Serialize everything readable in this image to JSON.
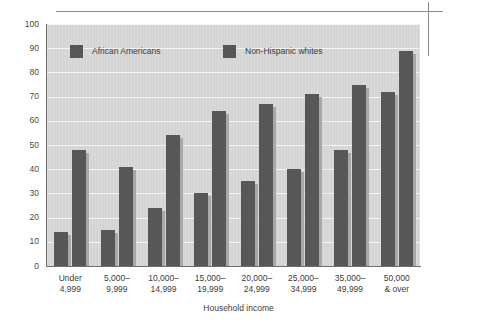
{
  "chart_data": {
    "type": "bar",
    "title": "",
    "subtitle": "",
    "xlabel": "Household income",
    "ylabel": "",
    "ylim": [
      0,
      100
    ],
    "ytick_step": 10,
    "yticks": [
      "100",
      "90",
      "80",
      "70",
      "60",
      "50",
      "40",
      "30",
      "20",
      "10",
      "0"
    ],
    "grid": true,
    "legend_position": "top-inside",
    "categories": [
      "Under 4,999",
      "5,000–9,999",
      "10,000–14,999",
      "15,000–19,999",
      "20,000–24,999",
      "25,000–34,999",
      "35,000–49,999",
      "50,000 & over"
    ],
    "category_lines": [
      [
        "Under",
        "4,999"
      ],
      [
        "5,000–",
        "9,999"
      ],
      [
        "10,000–",
        "14,999"
      ],
      [
        "15,000–",
        "19,999"
      ],
      [
        "20,000–",
        "24,999"
      ],
      [
        "25,000–",
        "34,999"
      ],
      [
        "35,000–",
        "49,999"
      ],
      [
        "50,000",
        "& over"
      ]
    ],
    "series": [
      {
        "name": "African Americans",
        "color": "#575757",
        "values": [
          14,
          15,
          24,
          30,
          35,
          40,
          48,
          72
        ]
      },
      {
        "name": "Non-Hispanic whites",
        "color": "#575757",
        "values": [
          48,
          41,
          54,
          64,
          67,
          71,
          75,
          89
        ]
      }
    ]
  },
  "legend": {
    "entries": [
      {
        "label": "African Americans"
      },
      {
        "label": "Non-Hispanic whites"
      }
    ]
  },
  "colors": {
    "bar": "#575757",
    "bar_shadow": "#a8a8a8",
    "plot_background": "#d4d4d4",
    "gridline": "#f4f4f4",
    "axis": "#6e6e6e",
    "text": "#3d3d3d",
    "rule": "#8c8c8c",
    "page_background": "#ffffff"
  }
}
